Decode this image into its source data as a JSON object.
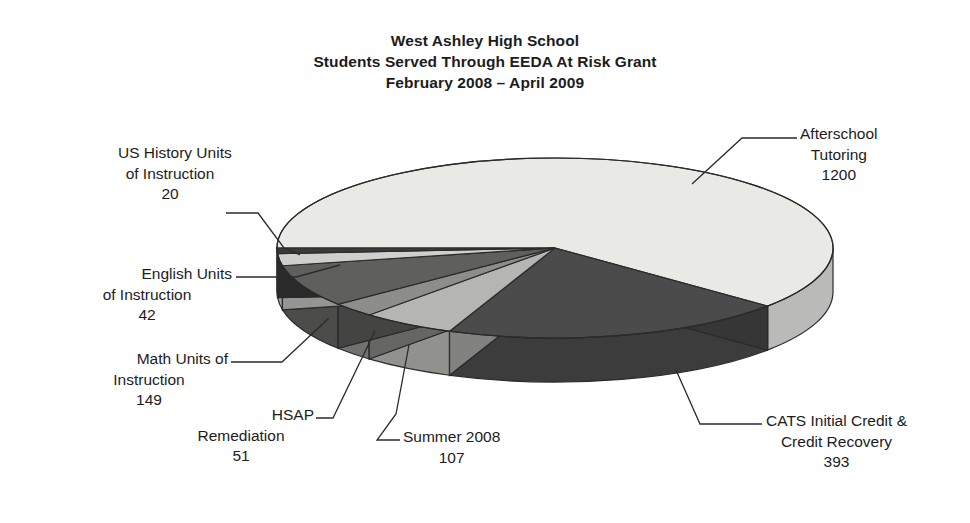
{
  "title": {
    "line1": "West Ashley High School",
    "line2": "Students Served Through EEDA At Risk Grant",
    "line3": "February 2008 – April 2009"
  },
  "chart_data": {
    "type": "pie",
    "title": "West Ashley High School Students Served Through EEDA At Risk Grant February 2008 – April 2009",
    "three_d": true,
    "start_angle_deg": 180,
    "direction": "clockwise",
    "total": 1962,
    "legend": "none",
    "grid": false,
    "categories": [
      "Afterschool Tutoring",
      "CATS Initial Credit & Credit Recovery",
      "Summer 2008",
      "HSAP Remediation",
      "Math Units of Instruction",
      "English Units of Instruction",
      "US History Units of Instruction"
    ],
    "values": [
      1200,
      393,
      107,
      51,
      149,
      42,
      20
    ],
    "percentages": [
      61.2,
      20.0,
      5.5,
      2.6,
      7.6,
      2.1,
      1.0
    ],
    "colors": [
      "#e9e9e6",
      "#4b4b4b",
      "#b5b5b2",
      "#8d8d8a",
      "#5f5f5d",
      "#cfcfcc",
      "#3a3a3a"
    ],
    "slices": [
      {
        "label": "Afterschool Tutoring",
        "value": 1200,
        "color": "#e9e9e6"
      },
      {
        "label": "CATS Initial Credit & Credit Recovery",
        "value": 393,
        "color": "#4b4b4b"
      },
      {
        "label": "Summer 2008",
        "value": 107,
        "color": "#b5b5b2"
      },
      {
        "label": "HSAP Remediation",
        "value": 51,
        "color": "#8d8d8a"
      },
      {
        "label": "Math Units of Instruction",
        "value": 149,
        "color": "#5f5f5d"
      },
      {
        "label": "English Units of Instruction",
        "value": 42,
        "color": "#cfcfcc"
      },
      {
        "label": "US History Units of Instruction",
        "value": 20,
        "color": "#3a3a3a"
      }
    ]
  },
  "callouts": {
    "afterschool": {
      "l1": "Afterschool",
      "l2": "Tutoring",
      "l3": "1200"
    },
    "cats": {
      "l1": "CATS Initial Credit &",
      "l2": "Credit Recovery",
      "l3": "393"
    },
    "summer": {
      "l1": "Summer 2008",
      "l2": "107"
    },
    "hsap": {
      "l1": "HSAP",
      "l2": "Remediation",
      "l3": "51"
    },
    "math": {
      "l1": "Math Units of",
      "l2": "Instruction",
      "l3": "149"
    },
    "english": {
      "l1": "English Units",
      "l2": "of Instruction",
      "l3": "42"
    },
    "ushistory": {
      "l1": "US History Units",
      "l2": "of Instruction",
      "l3": "20"
    }
  }
}
